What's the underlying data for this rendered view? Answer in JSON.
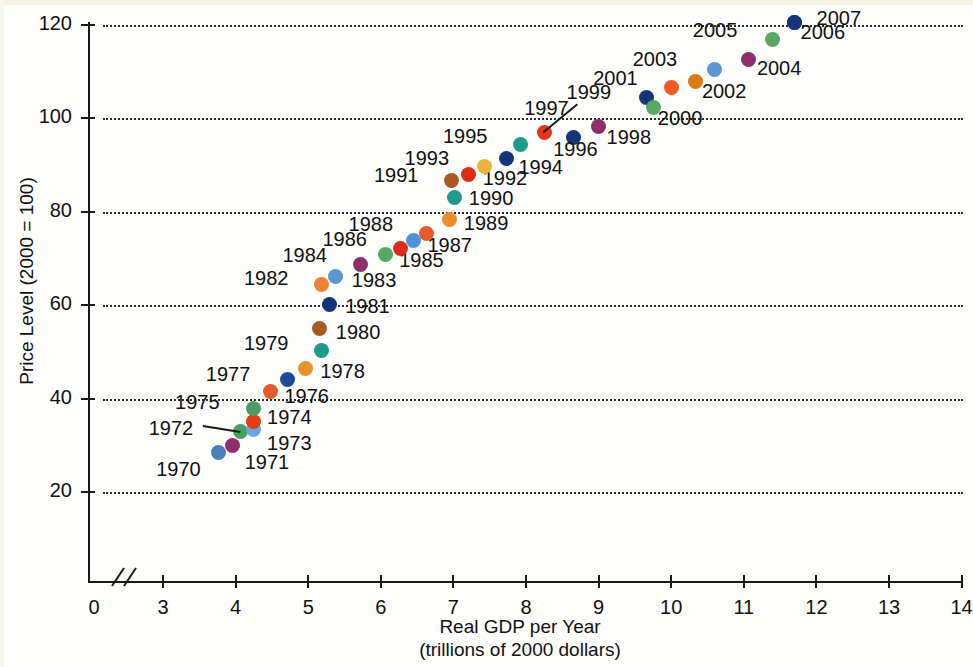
{
  "chart_data": {
    "type": "scatter",
    "title": "",
    "xlabel": "Real GDP per Year",
    "xlabel_sub": "(trillions of 2000 dollars)",
    "ylabel": "Price Level (2000 = 100)",
    "xlim": [
      3,
      14
    ],
    "ylim": [
      0,
      126
    ],
    "xticks": [
      "0",
      "3",
      "4",
      "5",
      "6",
      "7",
      "8",
      "9",
      "10",
      "11",
      "12",
      "13",
      "14"
    ],
    "yticks": [
      "20",
      "40",
      "60",
      "80",
      "100",
      "120"
    ],
    "grid": "horizontal-dotted",
    "legend": "none",
    "axis_break_x": true,
    "points": [
      {
        "label": "1970",
        "x": 3.76,
        "y": 28.5,
        "color": "#4a7ebb",
        "lx": -62,
        "ly": 18
      },
      {
        "label": "1971",
        "x": 3.96,
        "y": 30.0,
        "color": "#8e2f6b",
        "lx": 12,
        "ly": 18
      },
      {
        "label": "1972",
        "x": 4.07,
        "y": 33.0,
        "color": "#4a9e63",
        "lx": -92,
        "ly": -2,
        "leader": true
      },
      {
        "label": "1973",
        "x": 4.24,
        "y": 33.3,
        "color": "#6aa6dd",
        "lx": 14,
        "ly": 14
      },
      {
        "label": "1974",
        "x": 4.24,
        "y": 35.2,
        "color": "#e03c1a",
        "lx": 14,
        "ly": -3
      },
      {
        "label": "1975",
        "x": 4.24,
        "y": 37.8,
        "color": "#4a9e63",
        "lx": -78,
        "ly": -6
      },
      {
        "label": "1976",
        "x": 4.48,
        "y": 41.6,
        "color": "#e35b28",
        "lx": 14,
        "ly": 6
      },
      {
        "label": "1977",
        "x": 4.72,
        "y": 44.0,
        "color": "#1d4b9c",
        "lx": -82,
        "ly": -5
      },
      {
        "label": "1978",
        "x": 4.96,
        "y": 46.4,
        "color": "#e8922b",
        "lx": 15,
        "ly": 3
      },
      {
        "label": "1979",
        "x": 5.19,
        "y": 50.2,
        "color": "#1f9b8e",
        "lx": -78,
        "ly": -7
      },
      {
        "label": "1980",
        "x": 5.16,
        "y": 55.0,
        "color": "#a85a22",
        "lx": 16,
        "ly": 4
      },
      {
        "label": "1981",
        "x": 5.29,
        "y": 60.2,
        "color": "#15357a",
        "lx": 16,
        "ly": 3
      },
      {
        "label": "1982",
        "x": 5.19,
        "y": 64.5,
        "color": "#ef8035",
        "lx": -78,
        "ly": -5
      },
      {
        "label": "1983",
        "x": 5.38,
        "y": 66.2,
        "color": "#5b96d2",
        "lx": 16,
        "ly": 5
      },
      {
        "label": "1984",
        "x": 5.72,
        "y": 68.8,
        "color": "#8e2f6b",
        "lx": -78,
        "ly": -8
      },
      {
        "label": "1985",
        "x": 6.06,
        "y": 70.8,
        "color": "#57a863",
        "lx": 14,
        "ly": 6
      },
      {
        "label": "1986",
        "x": 6.27,
        "y": 72.2,
        "color": "#e02a18",
        "lx": -78,
        "ly": -8
      },
      {
        "label": "1987",
        "x": 6.45,
        "y": 73.9,
        "color": "#4e93d4",
        "lx": 14,
        "ly": 6
      },
      {
        "label": "1988",
        "x": 6.63,
        "y": 75.3,
        "color": "#ea5a2c",
        "lx": -78,
        "ly": -9
      },
      {
        "label": "1989",
        "x": 6.95,
        "y": 78.3,
        "color": "#ee8c2e",
        "lx": 14,
        "ly": 4
      },
      {
        "label": "1990",
        "x": 7.02,
        "y": 83.1,
        "color": "#1f9b8e",
        "lx": 14,
        "ly": 2
      },
      {
        "label": "1991",
        "x": 6.98,
        "y": 86.6,
        "color": "#a85a22",
        "lx": -78,
        "ly": -5
      },
      {
        "label": "1992",
        "x": 7.21,
        "y": 87.9,
        "color": "#e02a18",
        "lx": 14,
        "ly": 4
      },
      {
        "label": "1993",
        "x": 7.43,
        "y": 89.7,
        "color": "#f0b13c",
        "lx": -80,
        "ly": -8
      },
      {
        "label": "1994",
        "x": 7.73,
        "y": 91.5,
        "color": "#15357a",
        "lx": 12,
        "ly": 10
      },
      {
        "label": "1995",
        "x": 7.93,
        "y": 94.4,
        "color": "#1f9b8e",
        "lx": -78,
        "ly": -8
      },
      {
        "label": "1996",
        "x": 8.65,
        "y": 95.9,
        "color": "#15357a",
        "lx": -20,
        "ly": 12
      },
      {
        "label": "1997",
        "x": 8.25,
        "y": 96.9,
        "color": "#e8341c",
        "lx": -20,
        "ly": -24,
        "leader": true
      },
      {
        "label": "1998",
        "x": 9.0,
        "y": 98.3,
        "color": "#8e2f6b",
        "lx": 8,
        "ly": 12
      },
      {
        "label": "1999",
        "x": 9.66,
        "y": 104.5,
        "color": "#15357a",
        "lx": -80,
        "ly": -4
      },
      {
        "label": "2000",
        "x": 9.76,
        "y": 102.4,
        "color": "#57a863",
        "lx": 4,
        "ly": 12
      },
      {
        "label": "2001",
        "x": 10.0,
        "y": 106.6,
        "color": "#ee5a28",
        "lx": -78,
        "ly": -9
      },
      {
        "label": "2002",
        "x": 10.34,
        "y": 107.9,
        "color": "#d97a14",
        "lx": 6,
        "ly": 10
      },
      {
        "label": "2003",
        "x": 10.6,
        "y": 110.5,
        "color": "#5b96d2",
        "lx": -82,
        "ly": -9
      },
      {
        "label": "2004",
        "x": 11.07,
        "y": 112.7,
        "color": "#8e2f6b",
        "lx": 8,
        "ly": 10
      },
      {
        "label": "2005",
        "x": 11.4,
        "y": 116.8,
        "color": "#57a863",
        "lx": -80,
        "ly": -9
      },
      {
        "label": "2006",
        "x": 11.7,
        "y": 120.6,
        "color": "#15357a",
        "lx": 6,
        "ly": 11
      },
      {
        "label": "2007",
        "x": 11.7,
        "y": 120.6,
        "color": "#15357a",
        "lx": 22,
        "ly": -3
      }
    ]
  }
}
